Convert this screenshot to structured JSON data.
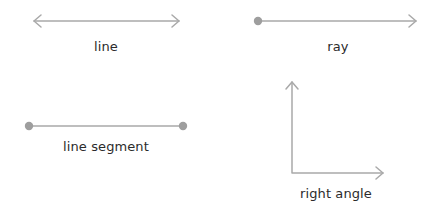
{
  "diagram": {
    "stroke_color": "#a9a9a9",
    "dot_color": "#9e9e9e",
    "figures": [
      {
        "id": "line",
        "label": "line"
      },
      {
        "id": "ray",
        "label": "ray"
      },
      {
        "id": "segment",
        "label": "line segment"
      },
      {
        "id": "right-angle",
        "label": "right angle"
      }
    ]
  }
}
